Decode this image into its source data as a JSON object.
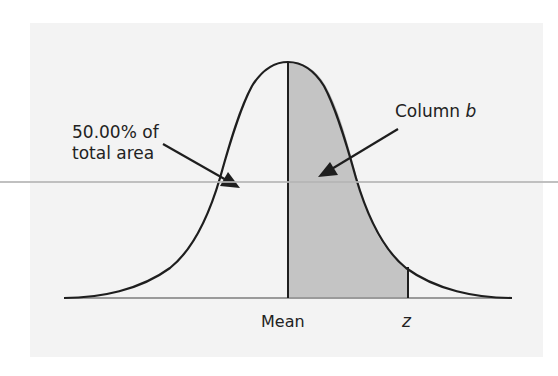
{
  "diagram": {
    "type": "normal-distribution",
    "annotations": {
      "left_label_line1": "50.00% of",
      "left_label_line2": "total area",
      "right_label_prefix": "Column ",
      "right_label_var": "b"
    },
    "axis_labels": {
      "mean": "Mean",
      "z": "z"
    },
    "colors": {
      "panel_bg": "#f3f3f3",
      "curve": "#1e1e1e",
      "shaded_area": "#c4c4c4",
      "baseline": "#9a9a9a",
      "stray_line": "#b5b5b5"
    },
    "regions": [
      {
        "name": "left-half",
        "description": "area left of mean",
        "value": "50.00% of total area",
        "shaded": false
      },
      {
        "name": "column-b",
        "description": "area between mean and z",
        "shaded": true
      }
    ]
  }
}
